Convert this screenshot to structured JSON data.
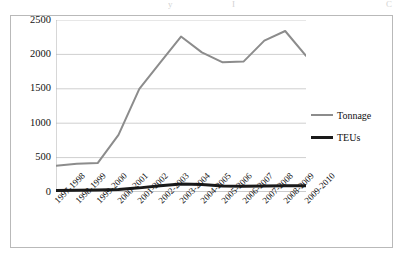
{
  "artifact": {
    "top_text_fragments": [
      "y",
      "I",
      "C"
    ]
  },
  "legend": {
    "position": "right",
    "entries": [
      {
        "label": "Tonnage",
        "color": "#8c8c8c",
        "icon": "line-swatch-gray"
      },
      {
        "label": "TEUs",
        "color": "#1a1a1a",
        "icon": "line-swatch-black"
      }
    ]
  },
  "axes": {
    "y_ticks": [
      "2500",
      "2000",
      "1500",
      "1000",
      "500",
      "0"
    ],
    "x_ticks": [
      "1997-1998",
      "1998-1999",
      "1999-2000",
      "2000-2001",
      "2001-2002",
      "2002-2003",
      "2003-2004",
      "2004-2005",
      "2005-2006",
      "2006-2007",
      "2007-2008",
      "2008-2009",
      "2009-2010"
    ]
  },
  "chart_data": {
    "type": "line",
    "title": "",
    "xlabel": "",
    "ylabel": "",
    "ylim": [
      0,
      2500
    ],
    "ytick_step": 500,
    "grid": true,
    "legend_position": "right",
    "categories": [
      "1997-1998",
      "1998-1999",
      "1999-2000",
      "2000-2001",
      "2001-2002",
      "2002-2003",
      "2003-2004",
      "2004-2005",
      "2005-2006",
      "2006-2007",
      "2007-2008",
      "2008-2009",
      "2009-2010"
    ],
    "series": [
      {
        "name": "Tonnage",
        "color": "#8c8c8c",
        "width": 2,
        "values": [
          380,
          410,
          420,
          830,
          1500,
          1880,
          2260,
          2030,
          1885,
          1895,
          2200,
          2340,
          1980
        ]
      },
      {
        "name": "TEUs",
        "color": "#1a1a1a",
        "width": 3,
        "values": [
          22,
          25,
          30,
          38,
          60,
          92,
          115,
          108,
          88,
          85,
          88,
          92,
          90
        ]
      }
    ]
  }
}
